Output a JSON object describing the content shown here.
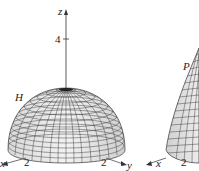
{
  "figure_left": {
    "surface_label": "H",
    "axis_z_label": "z",
    "axis_x_label": "x",
    "axis_y_label": "y",
    "z_tick": "4",
    "x_tick": "2",
    "y_tick": "2"
  },
  "figure_right": {
    "surface_label": "P",
    "axis_x_label": "x",
    "x_tick": "2"
  },
  "colors": {
    "surface_fill": "#e6e6e6",
    "mesh_line": "#333333",
    "axis": "#333333"
  }
}
